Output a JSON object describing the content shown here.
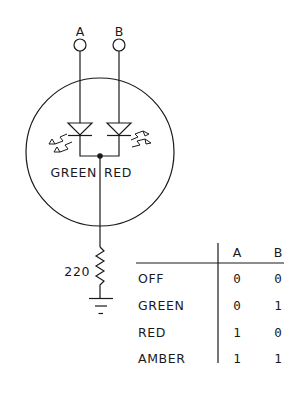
{
  "diagram": {
    "type": "bicolor-led-circuit",
    "terminals": [
      {
        "label": "A"
      },
      {
        "label": "B"
      }
    ],
    "led_labels": {
      "left": "GREEN",
      "right": "RED"
    },
    "resistor": {
      "value": "220"
    },
    "colors": {
      "stroke": "#1a1a1a",
      "background": "#ffffff"
    }
  },
  "truth_table": {
    "columns": [
      "A",
      "B"
    ],
    "rows": [
      {
        "label": "OFF",
        "a": "0",
        "b": "0"
      },
      {
        "label": "GREEN",
        "a": "0",
        "b": "1"
      },
      {
        "label": "RED",
        "a": "1",
        "b": "0"
      },
      {
        "label": "AMBER",
        "a": "1",
        "b": "1"
      }
    ]
  }
}
